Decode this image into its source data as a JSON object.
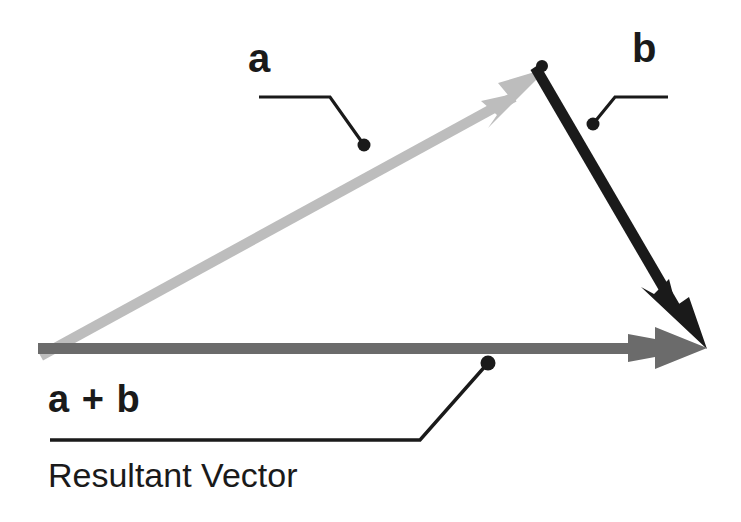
{
  "diagram": {
    "background_color": "#ffffff",
    "labels": {
      "vector_a": "a",
      "vector_b": "b",
      "resultant_sum": "a + b",
      "resultant_caption": "Resultant Vector"
    },
    "colors": {
      "vector_a": "#bdbdbd",
      "vector_b": "#1a1a1a",
      "resultant": "#6b6b6b",
      "leader_line": "#1a1a1a",
      "text": "#1a1a1a"
    },
    "vectors": [
      {
        "name": "a",
        "label": "a",
        "color": "#bdbdbd",
        "start": {
          "x": 38,
          "y": 347
        },
        "end": {
          "x": 548,
          "y": 68
        },
        "shaft_width": 9,
        "arrowhead": "barbed"
      },
      {
        "name": "b",
        "label": "b",
        "color": "#1a1a1a",
        "start": {
          "x": 543,
          "y": 66
        },
        "end": {
          "x": 707,
          "y": 349
        },
        "shaft_width": 9,
        "arrowhead": "barbed"
      },
      {
        "name": "a-plus-b",
        "label": "a + b",
        "color": "#6b6b6b",
        "start": {
          "x": 38,
          "y": 348
        },
        "end": {
          "x": 707,
          "y": 348
        },
        "shaft_width": 11,
        "arrowhead": "barbed"
      }
    ],
    "leaders": [
      {
        "name": "leader-a",
        "dot": {
          "x": 364,
          "y": 145
        },
        "dot_radius": 6,
        "path": "M 259 97 L 330 97 L 364 145"
      },
      {
        "name": "leader-b",
        "dot": {
          "x": 593,
          "y": 124
        },
        "dot_radius": 6,
        "path": "M 668 97 L 615 97 L 593 124"
      },
      {
        "name": "leader-resultant",
        "dot": {
          "x": 488,
          "y": 363
        },
        "dot_radius": 7,
        "path": "M 50 440 L 420 440 L 488 363"
      }
    ]
  }
}
